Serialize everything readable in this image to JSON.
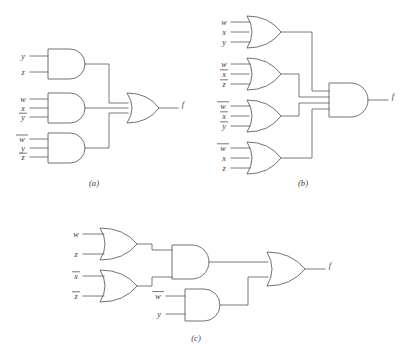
{
  "figure": {
    "title": "",
    "background_color": "#ffffff",
    "line_color": "#58585a",
    "text_color": "#3a3a3a"
  },
  "panels": [
    {
      "id": "a",
      "caption": "(a)",
      "output_label": "f",
      "structure": "sum-of-products: three AND gates feeding one OR gate",
      "gates": [
        {
          "name": "and-gate-a1",
          "type": "AND",
          "inputs": [
            {
              "label": "y",
              "overbar": false
            },
            {
              "label": "z",
              "overbar": false
            }
          ]
        },
        {
          "name": "and-gate-a2",
          "type": "AND",
          "inputs": [
            {
              "label": "w",
              "overbar": false
            },
            {
              "label": "x",
              "overbar": false
            },
            {
              "label": "y",
              "overbar": true
            }
          ]
        },
        {
          "name": "and-gate-a3",
          "type": "AND",
          "inputs": [
            {
              "label": "w",
              "overbar": true
            },
            {
              "label": "y",
              "overbar": false
            },
            {
              "label": "z",
              "overbar": true
            }
          ]
        },
        {
          "name": "or-gate-a-out",
          "type": "OR",
          "inputs": []
        }
      ]
    },
    {
      "id": "b",
      "caption": "(b)",
      "output_label": "f",
      "structure": "product-of-sums: four OR gates feeding one AND gate",
      "gates": [
        {
          "name": "or-gate-b1",
          "type": "OR",
          "inputs": [
            {
              "label": "w",
              "overbar": false
            },
            {
              "label": "x",
              "overbar": false
            },
            {
              "label": "y",
              "overbar": false
            }
          ]
        },
        {
          "name": "or-gate-b2",
          "type": "OR",
          "inputs": [
            {
              "label": "w",
              "overbar": false
            },
            {
              "label": "x",
              "overbar": true
            },
            {
              "label": "z",
              "overbar": true
            }
          ]
        },
        {
          "name": "or-gate-b3",
          "type": "OR",
          "inputs": [
            {
              "label": "w",
              "overbar": true
            },
            {
              "label": "x",
              "overbar": true
            },
            {
              "label": "y",
              "overbar": true
            }
          ]
        },
        {
          "name": "or-gate-b4",
          "type": "OR",
          "inputs": [
            {
              "label": "w",
              "overbar": true
            },
            {
              "label": "x",
              "overbar": false
            },
            {
              "label": "z",
              "overbar": false
            }
          ]
        },
        {
          "name": "and-gate-b-out",
          "type": "AND",
          "inputs": []
        }
      ]
    },
    {
      "id": "c",
      "caption": "(c)",
      "output_label": "f",
      "structure": "factored form: two OR gates into an AND gate, combined with a second AND gate in a final OR gate",
      "gates": [
        {
          "name": "or-gate-c1",
          "type": "OR",
          "inputs": [
            {
              "label": "w",
              "overbar": false
            },
            {
              "label": "z",
              "overbar": false
            }
          ]
        },
        {
          "name": "or-gate-c2",
          "type": "OR",
          "inputs": [
            {
              "label": "x",
              "overbar": true
            },
            {
              "label": "z",
              "overbar": false
            }
          ]
        },
        {
          "name": "and-gate-c1",
          "type": "AND",
          "inputs": []
        },
        {
          "name": "and-gate-c2",
          "type": "AND",
          "inputs": [
            {
              "label": "w",
              "overbar": true
            },
            {
              "label": "y",
              "overbar": false
            }
          ]
        },
        {
          "name": "or-gate-c-out",
          "type": "OR",
          "inputs": []
        }
      ]
    }
  ],
  "labels": {
    "a_in1": "y",
    "a_in2": "z",
    "a_in3": "w",
    "a_in4": "x",
    "a_in5": "y",
    "a_in6": "w",
    "a_in7": "y",
    "a_in8": "z",
    "a_out": "f",
    "a_cap": "(a)",
    "b_in1": "w",
    "b_in2": "x",
    "b_in3": "y",
    "b_in4": "w",
    "b_in5": "x",
    "b_in6": "z",
    "b_in7": "w",
    "b_in8": "x",
    "b_in9": "y",
    "b_in10": "w",
    "b_in11": "x",
    "b_in12": "z",
    "b_out": "f",
    "b_cap": "(b)",
    "c_in1": "w",
    "c_in2": "z",
    "c_in3": "x",
    "c_in4": "z",
    "c_in5": "w",
    "c_in6": "y",
    "c_out": "f",
    "c_cap": "(c)"
  }
}
